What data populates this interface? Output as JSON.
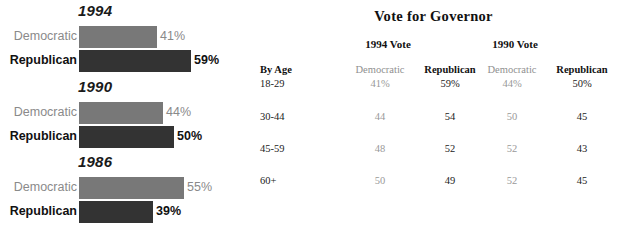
{
  "chart_data": {
    "type": "bar",
    "title": "",
    "orientation": "horizontal",
    "xlabel": "",
    "ylabel": "",
    "xlim": [
      0,
      100
    ],
    "grid": false,
    "legend": "none",
    "groups": [
      {
        "year": "1994",
        "bars": [
          {
            "party": "Democratic",
            "label": "Democratic",
            "value": 41,
            "value_label": "41%",
            "color": "#787878"
          },
          {
            "party": "Republican",
            "label": "Republican",
            "value": 59,
            "value_label": "59%",
            "color": "#333333"
          }
        ]
      },
      {
        "year": "1990",
        "bars": [
          {
            "party": "Democratic",
            "label": "Democratic",
            "value": 44,
            "value_label": "44%",
            "color": "#787878"
          },
          {
            "party": "Republican",
            "label": "Republican",
            "value": 50,
            "value_label": "50%",
            "color": "#333333"
          }
        ]
      },
      {
        "year": "1986",
        "bars": [
          {
            "party": "Democratic",
            "label": "Democratic",
            "value": 55,
            "value_label": "55%",
            "color": "#787878"
          },
          {
            "party": "Republican",
            "label": "Republican",
            "value": 39,
            "value_label": "39%",
            "color": "#333333"
          }
        ]
      }
    ],
    "colors": {
      "democratic_bar": "#787878",
      "republican_bar": "#333333",
      "democratic_text": "#8a8a8a",
      "republican_text": "#111111"
    }
  },
  "table": {
    "title": "Vote for Governor",
    "year_headers": [
      "1994 Vote",
      "1990 Vote"
    ],
    "row_header_label": "By Age",
    "column_headers": [
      "Democratic",
      "Republican",
      "Democratic",
      "Republican"
    ],
    "rows": [
      {
        "label": "18-29",
        "values": [
          "41%",
          "59%",
          "44%",
          "50%"
        ]
      },
      {
        "label": "30-44",
        "values": [
          "44",
          "54",
          "50",
          "45"
        ]
      },
      {
        "label": "45-59",
        "values": [
          "48",
          "52",
          "52",
          "43"
        ]
      },
      {
        "label": "60+",
        "values": [
          "50",
          "49",
          "52",
          "45"
        ]
      }
    ]
  }
}
